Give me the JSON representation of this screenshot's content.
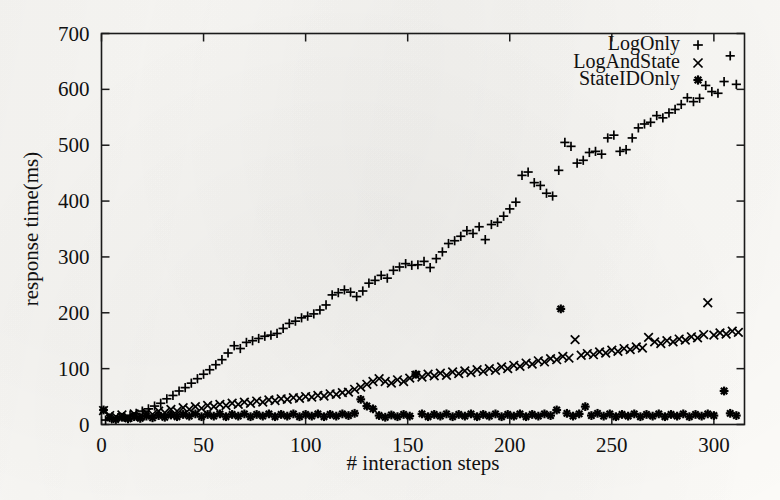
{
  "chart_data": {
    "type": "scatter",
    "title": "",
    "xlabel": "# interaction steps",
    "ylabel": "response time(ms)",
    "xlim": [
      0,
      315
    ],
    "ylim": [
      0,
      700
    ],
    "xticks": [
      0,
      50,
      100,
      150,
      200,
      250,
      300
    ],
    "yticks": [
      0,
      100,
      200,
      300,
      400,
      500,
      600,
      700
    ],
    "grid": false,
    "legend_position": "top-right",
    "series": [
      {
        "name": "LogOnly",
        "marker": "plus",
        "color": "#000000",
        "points": [
          [
            2,
            8
          ],
          [
            5,
            10
          ],
          [
            8,
            12
          ],
          [
            11,
            14
          ],
          [
            14,
            16
          ],
          [
            17,
            20
          ],
          [
            20,
            24
          ],
          [
            23,
            28
          ],
          [
            26,
            33
          ],
          [
            29,
            38
          ],
          [
            32,
            46
          ],
          [
            35,
            52
          ],
          [
            38,
            60
          ],
          [
            41,
            66
          ],
          [
            44,
            74
          ],
          [
            47,
            82
          ],
          [
            50,
            90
          ],
          [
            53,
            98
          ],
          [
            56,
            107
          ],
          [
            59,
            116
          ],
          [
            62,
            128
          ],
          [
            65,
            141
          ],
          [
            68,
            136
          ],
          [
            71,
            147
          ],
          [
            74,
            150
          ],
          [
            77,
            154
          ],
          [
            80,
            158
          ],
          [
            83,
            160
          ],
          [
            86,
            163
          ],
          [
            89,
            172
          ],
          [
            92,
            181
          ],
          [
            95,
            185
          ],
          [
            98,
            191
          ],
          [
            101,
            194
          ],
          [
            104,
            198
          ],
          [
            107,
            205
          ],
          [
            110,
            214
          ],
          [
            113,
            232
          ],
          [
            116,
            236
          ],
          [
            119,
            241
          ],
          [
            122,
            237
          ],
          [
            125,
            229
          ],
          [
            128,
            239
          ],
          [
            131,
            253
          ],
          [
            134,
            258
          ],
          [
            137,
            267
          ],
          [
            140,
            262
          ],
          [
            143,
            276
          ],
          [
            146,
            282
          ],
          [
            149,
            288
          ],
          [
            152,
            285
          ],
          [
            155,
            286
          ],
          [
            158,
            292
          ],
          [
            161,
            281
          ],
          [
            164,
            297
          ],
          [
            167,
            309
          ],
          [
            170,
            324
          ],
          [
            173,
            329
          ],
          [
            176,
            337
          ],
          [
            179,
            347
          ],
          [
            182,
            342
          ],
          [
            185,
            354
          ],
          [
            188,
            331
          ],
          [
            191,
            358
          ],
          [
            194,
            362
          ],
          [
            197,
            373
          ],
          [
            200,
            386
          ],
          [
            203,
            398
          ],
          [
            206,
            446
          ],
          [
            209,
            452
          ],
          [
            212,
            433
          ],
          [
            215,
            428
          ],
          [
            218,
            414
          ],
          [
            221,
            409
          ],
          [
            224,
            455
          ],
          [
            227,
            505
          ],
          [
            230,
            498
          ],
          [
            233,
            468
          ],
          [
            236,
            473
          ],
          [
            239,
            487
          ],
          [
            242,
            489
          ],
          [
            245,
            484
          ],
          [
            248,
            513
          ],
          [
            251,
            518
          ],
          [
            254,
            489
          ],
          [
            257,
            492
          ],
          [
            260,
            513
          ],
          [
            263,
            531
          ],
          [
            266,
            538
          ],
          [
            269,
            541
          ],
          [
            272,
            553
          ],
          [
            275,
            549
          ],
          [
            278,
            558
          ],
          [
            281,
            564
          ],
          [
            284,
            573
          ],
          [
            287,
            585
          ],
          [
            290,
            578
          ],
          [
            293,
            584
          ],
          [
            296,
            607
          ],
          [
            299,
            596
          ],
          [
            302,
            593
          ],
          [
            305,
            614
          ],
          [
            308,
            660
          ],
          [
            311,
            609
          ]
        ]
      },
      {
        "name": "LogAndState",
        "marker": "cross",
        "color": "#000000",
        "points": [
          [
            1,
            25
          ],
          [
            4,
            16
          ],
          [
            7,
            14
          ],
          [
            10,
            17
          ],
          [
            13,
            13
          ],
          [
            16,
            19
          ],
          [
            19,
            15
          ],
          [
            22,
            21
          ],
          [
            25,
            18
          ],
          [
            28,
            24
          ],
          [
            31,
            21
          ],
          [
            34,
            27
          ],
          [
            37,
            24
          ],
          [
            40,
            30
          ],
          [
            43,
            27
          ],
          [
            46,
            32
          ],
          [
            49,
            29
          ],
          [
            52,
            34
          ],
          [
            55,
            32
          ],
          [
            58,
            36
          ],
          [
            61,
            34
          ],
          [
            64,
            38
          ],
          [
            67,
            36
          ],
          [
            70,
            40
          ],
          [
            73,
            38
          ],
          [
            76,
            42
          ],
          [
            79,
            40
          ],
          [
            82,
            44
          ],
          [
            85,
            43
          ],
          [
            88,
            46
          ],
          [
            91,
            45
          ],
          [
            94,
            48
          ],
          [
            97,
            47
          ],
          [
            100,
            50
          ],
          [
            103,
            49
          ],
          [
            106,
            52
          ],
          [
            109,
            51
          ],
          [
            112,
            55
          ],
          [
            115,
            54
          ],
          [
            118,
            57
          ],
          [
            121,
            58
          ],
          [
            124,
            63
          ],
          [
            127,
            67
          ],
          [
            130,
            72
          ],
          [
            133,
            77
          ],
          [
            136,
            82
          ],
          [
            139,
            77
          ],
          [
            142,
            74
          ],
          [
            145,
            80
          ],
          [
            148,
            77
          ],
          [
            151,
            83
          ],
          [
            154,
            88
          ],
          [
            157,
            85
          ],
          [
            160,
            90
          ],
          [
            163,
            87
          ],
          [
            166,
            92
          ],
          [
            169,
            88
          ],
          [
            172,
            94
          ],
          [
            175,
            91
          ],
          [
            178,
            96
          ],
          [
            181,
            93
          ],
          [
            184,
            98
          ],
          [
            187,
            95
          ],
          [
            190,
            100
          ],
          [
            193,
            97
          ],
          [
            196,
            103
          ],
          [
            199,
            100
          ],
          [
            202,
            106
          ],
          [
            205,
            104
          ],
          [
            208,
            110
          ],
          [
            211,
            108
          ],
          [
            214,
            114
          ],
          [
            217,
            112
          ],
          [
            220,
            118
          ],
          [
            223,
            116
          ],
          [
            226,
            122
          ],
          [
            229,
            119
          ],
          [
            232,
            152
          ],
          [
            235,
            124
          ],
          [
            238,
            127
          ],
          [
            241,
            125
          ],
          [
            244,
            130
          ],
          [
            247,
            128
          ],
          [
            250,
            133
          ],
          [
            253,
            131
          ],
          [
            256,
            136
          ],
          [
            259,
            134
          ],
          [
            262,
            139
          ],
          [
            265,
            137
          ],
          [
            268,
            156
          ],
          [
            271,
            148
          ],
          [
            274,
            145
          ],
          [
            277,
            150
          ],
          [
            280,
            148
          ],
          [
            283,
            153
          ],
          [
            286,
            151
          ],
          [
            289,
            157
          ],
          [
            292,
            155
          ],
          [
            295,
            161
          ],
          [
            297,
            218
          ],
          [
            300,
            160
          ],
          [
            303,
            164
          ],
          [
            306,
            162
          ],
          [
            309,
            167
          ],
          [
            312,
            165
          ]
        ]
      },
      {
        "name": "StateIDOnly",
        "marker": "star",
        "color": "#000000",
        "points": [
          [
            1,
            26
          ],
          [
            4,
            12
          ],
          [
            7,
            9
          ],
          [
            10,
            13
          ],
          [
            13,
            10
          ],
          [
            16,
            14
          ],
          [
            19,
            11
          ],
          [
            22,
            15
          ],
          [
            25,
            12
          ],
          [
            28,
            16
          ],
          [
            31,
            13
          ],
          [
            34,
            17
          ],
          [
            37,
            14
          ],
          [
            40,
            18
          ],
          [
            43,
            15
          ],
          [
            46,
            19
          ],
          [
            49,
            14
          ],
          [
            52,
            18
          ],
          [
            55,
            15
          ],
          [
            58,
            19
          ],
          [
            61,
            14
          ],
          [
            64,
            18
          ],
          [
            67,
            15
          ],
          [
            70,
            19
          ],
          [
            73,
            14
          ],
          [
            76,
            18
          ],
          [
            79,
            15
          ],
          [
            82,
            19
          ],
          [
            85,
            14
          ],
          [
            88,
            18
          ],
          [
            91,
            15
          ],
          [
            94,
            19
          ],
          [
            97,
            14
          ],
          [
            100,
            18
          ],
          [
            103,
            15
          ],
          [
            106,
            19
          ],
          [
            109,
            14
          ],
          [
            112,
            18
          ],
          [
            115,
            15
          ],
          [
            118,
            19
          ],
          [
            121,
            16
          ],
          [
            124,
            20
          ],
          [
            127,
            45
          ],
          [
            130,
            33
          ],
          [
            133,
            28
          ],
          [
            136,
            16
          ],
          [
            139,
            13
          ],
          [
            142,
            17
          ],
          [
            145,
            14
          ],
          [
            148,
            18
          ],
          [
            151,
            15
          ],
          [
            154,
            90
          ],
          [
            157,
            19
          ],
          [
            160,
            14
          ],
          [
            163,
            18
          ],
          [
            166,
            15
          ],
          [
            169,
            19
          ],
          [
            172,
            14
          ],
          [
            175,
            18
          ],
          [
            178,
            15
          ],
          [
            181,
            19
          ],
          [
            184,
            14
          ],
          [
            187,
            18
          ],
          [
            190,
            15
          ],
          [
            193,
            19
          ],
          [
            196,
            14
          ],
          [
            199,
            18
          ],
          [
            202,
            15
          ],
          [
            205,
            19
          ],
          [
            208,
            14
          ],
          [
            211,
            18
          ],
          [
            214,
            15
          ],
          [
            217,
            19
          ],
          [
            220,
            16
          ],
          [
            223,
            26
          ],
          [
            225,
            207
          ],
          [
            228,
            20
          ],
          [
            231,
            15
          ],
          [
            234,
            19
          ],
          [
            237,
            32
          ],
          [
            240,
            16
          ],
          [
            243,
            20
          ],
          [
            246,
            15
          ],
          [
            249,
            19
          ],
          [
            252,
            14
          ],
          [
            255,
            18
          ],
          [
            258,
            15
          ],
          [
            261,
            19
          ],
          [
            264,
            14
          ],
          [
            267,
            18
          ],
          [
            270,
            15
          ],
          [
            273,
            19
          ],
          [
            276,
            14
          ],
          [
            279,
            18
          ],
          [
            282,
            15
          ],
          [
            285,
            19
          ],
          [
            288,
            14
          ],
          [
            291,
            18
          ],
          [
            294,
            15
          ],
          [
            297,
            19
          ],
          [
            300,
            16
          ],
          [
            305,
            60
          ],
          [
            308,
            20
          ],
          [
            311,
            16
          ]
        ]
      }
    ]
  },
  "axes": {
    "x_tick_labels": [
      "0",
      "50",
      "100",
      "150",
      "200",
      "250",
      "300"
    ],
    "y_tick_labels": [
      "0",
      "100",
      "200",
      "300",
      "400",
      "500",
      "600",
      "700"
    ],
    "x_title": "# interaction steps",
    "y_title": "response time(ms)"
  },
  "legend": {
    "entries": [
      {
        "label": "LogOnly",
        "marker": "plus"
      },
      {
        "label": "LogAndState",
        "marker": "cross"
      },
      {
        "label": "StateIDOnly",
        "marker": "star"
      }
    ]
  }
}
